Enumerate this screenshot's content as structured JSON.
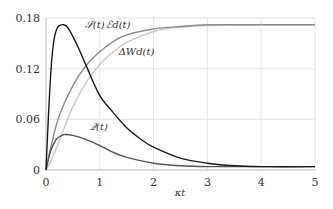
{
  "chart_data": {
    "type": "line",
    "title": "",
    "xlabel": "κt",
    "ylabel": "",
    "xlim": [
      0,
      5
    ],
    "ylim": [
      0,
      0.18
    ],
    "grid": true,
    "xticks": [
      0,
      1,
      2,
      3,
      4,
      5
    ],
    "xtick_labels": [
      "0",
      "1",
      "2",
      "3",
      "4",
      "5"
    ],
    "yticks": [
      0,
      0.06,
      0.12,
      0.18
    ],
    "ytick_labels": [
      "0",
      "0.06",
      "0.12",
      "0.18"
    ],
    "series": [
      {
        "name": "S(t)",
        "label": "𝒮(t)",
        "color": "#1a1a1a",
        "x": [
          0,
          0.05,
          0.1,
          0.15,
          0.2,
          0.25,
          0.33,
          0.4,
          0.5,
          0.6,
          0.75,
          1.0,
          1.25,
          1.5,
          1.75,
          2.0,
          2.5,
          3.0,
          3.5,
          4.0,
          5.0
        ],
        "y": [
          0,
          0.07,
          0.125,
          0.155,
          0.167,
          0.171,
          0.172,
          0.169,
          0.158,
          0.145,
          0.123,
          0.088,
          0.068,
          0.05,
          0.037,
          0.027,
          0.014,
          0.008,
          0.005,
          0.004,
          0.004
        ]
      },
      {
        "name": "Ed(t)",
        "label": "ℰd(t)",
        "color": "#8c8c8c",
        "x": [
          0,
          0.1,
          0.25,
          0.5,
          0.75,
          1.0,
          1.25,
          1.5,
          2.0,
          2.5,
          3.0,
          4.0,
          5.0
        ],
        "y": [
          0,
          0.03,
          0.065,
          0.1,
          0.124,
          0.14,
          0.152,
          0.16,
          0.167,
          0.17,
          0.172,
          0.172,
          0.172
        ]
      },
      {
        "name": "ΔWd(t)",
        "label": "ΔWd(t)",
        "color": "#c8c8c8",
        "x": [
          0,
          0.1,
          0.25,
          0.5,
          0.75,
          1.0,
          1.25,
          1.5,
          2.0,
          2.5,
          3.0,
          4.0,
          5.0
        ],
        "y": [
          0,
          0.012,
          0.035,
          0.075,
          0.104,
          0.125,
          0.14,
          0.151,
          0.164,
          0.169,
          0.171,
          0.172,
          0.172
        ]
      },
      {
        "name": "Q(t)",
        "label": "𝒬(t)",
        "color": "#555555",
        "x": [
          0,
          0.05,
          0.1,
          0.2,
          0.3,
          0.35,
          0.5,
          0.75,
          1.0,
          1.25,
          1.5,
          2.0,
          2.5,
          3.0,
          4.0,
          5.0
        ],
        "y": [
          0,
          0.014,
          0.025,
          0.037,
          0.041,
          0.042,
          0.041,
          0.036,
          0.029,
          0.021,
          0.015,
          0.008,
          0.005,
          0.004,
          0.004,
          0.004
        ]
      }
    ],
    "annotations": [
      {
        "text": "𝒮(t)",
        "series": "S(t)",
        "x": 0.72,
        "y": 0.168
      },
      {
        "text": "ℰd(t)",
        "series": "Ed(t)",
        "x": 1.12,
        "y": 0.168
      },
      {
        "text": "ΔWd(t)",
        "series": "ΔWd(t)",
        "x": 1.35,
        "y": 0.136
      },
      {
        "text": "𝒬(t)",
        "series": "Q(t)",
        "x": 0.8,
        "y": 0.047
      }
    ]
  }
}
